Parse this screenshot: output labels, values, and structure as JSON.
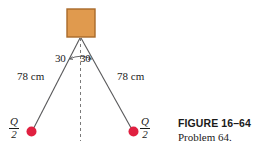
{
  "figure": {
    "block": {
      "name": "suspended block",
      "fill_color": "#E09A4E",
      "border_color": "#A96A2A"
    },
    "cords": {
      "color": "#58585a",
      "left_length_label": "78 cm",
      "right_length_label": "78 cm"
    },
    "angles": {
      "left_label": "30",
      "right_label": "30",
      "unit_hint": "degrees"
    },
    "centerline": {
      "style": "dashed",
      "color": "#7a7a7a"
    },
    "charges": {
      "color": "#E02040",
      "left": {
        "numerator": "Q",
        "denominator": "2"
      },
      "right": {
        "numerator": "Q",
        "denominator": "2"
      }
    }
  },
  "caption": {
    "title": "FIGURE 16–64",
    "subtitle": "Problem 64."
  }
}
